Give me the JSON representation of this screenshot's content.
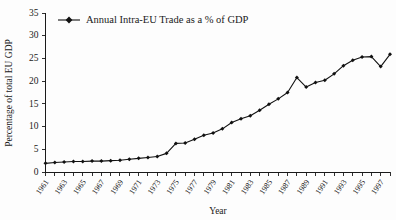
{
  "chart_data": {
    "type": "line",
    "title": "",
    "xlabel": "Year",
    "ylabel": "Percentage of total  EU GDP",
    "legend": [
      {
        "name": "Annual Intra-EU Trade as a % of GDP",
        "marker": "filled-diamond",
        "color": "#111111"
      }
    ],
    "legend_position": "top-left-inside",
    "grid": false,
    "xlim": [
      1961,
      1998
    ],
    "ylim": [
      0,
      35
    ],
    "yticks": [
      0,
      5,
      10,
      15,
      20,
      25,
      30,
      35
    ],
    "ytick_labels": [
      "0",
      "5",
      "10",
      "15",
      "20",
      "25",
      "30",
      "35"
    ],
    "xticks": [
      1961,
      1963,
      1965,
      1967,
      1969,
      1971,
      1973,
      1975,
      1977,
      1979,
      1981,
      1983,
      1985,
      1987,
      1989,
      1991,
      1993,
      1995,
      1997
    ],
    "xtick_labels": [
      "1961",
      "1963",
      "1965",
      "1967",
      "1969",
      "1971",
      "1973",
      "1975",
      "1977",
      "1979",
      "1981",
      "1983",
      "1985",
      "1987",
      "1989",
      "1991",
      "1993",
      "1995",
      "1997"
    ],
    "xtick_minor_every": 1,
    "x": [
      1961,
      1962,
      1963,
      1964,
      1965,
      1966,
      1967,
      1968,
      1969,
      1970,
      1971,
      1972,
      1973,
      1974,
      1975,
      1976,
      1977,
      1978,
      1979,
      1980,
      1981,
      1982,
      1983,
      1984,
      1985,
      1986,
      1987,
      1988,
      1989,
      1990,
      1991,
      1992,
      1993,
      1994,
      1995,
      1996,
      1997,
      1998
    ],
    "series": [
      {
        "name": "Annual Intra-EU Trade as a % of GDP",
        "values": [
          1.9,
          2.1,
          2.2,
          2.3,
          2.3,
          2.4,
          2.4,
          2.5,
          2.6,
          2.8,
          3.0,
          3.2,
          3.4,
          4.1,
          6.3,
          6.4,
          7.2,
          8.1,
          8.6,
          9.5,
          10.9,
          11.7,
          12.4,
          13.6,
          14.9,
          16.1,
          17.5,
          20.8,
          18.7,
          19.7,
          20.2,
          21.6,
          23.4,
          24.6,
          25.3,
          25.4,
          23.2,
          25.9
        ]
      }
    ],
    "annotations": []
  },
  "figure": {
    "background_color": "#fdfdfd",
    "line_color": "#111111",
    "axis_color": "#1a1a1a"
  }
}
